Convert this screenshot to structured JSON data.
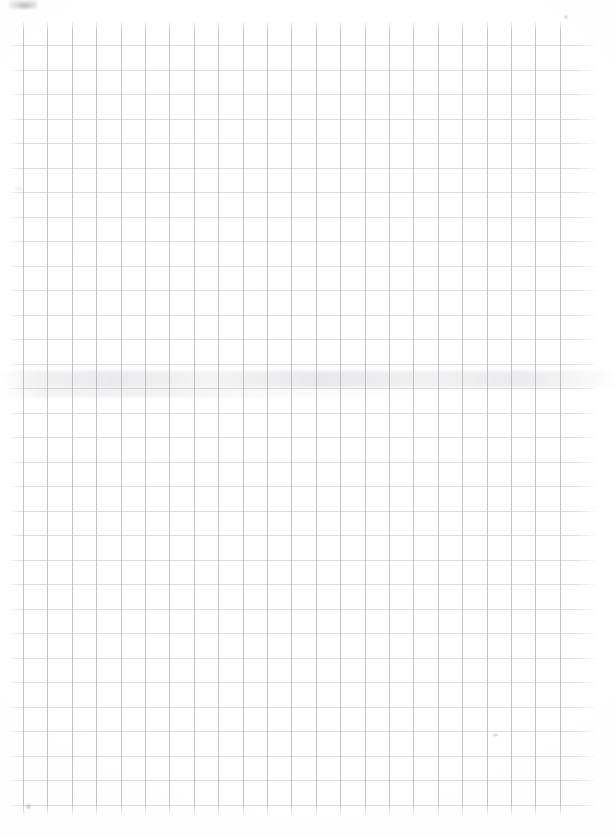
{
  "document": {
    "type": "scanned-grid-paper",
    "title": "",
    "visible_text": "",
    "background_color": "#ffffff"
  },
  "grid": {
    "name": "graph-paper-grid",
    "line_color_horizontal": "#c9cacd",
    "line_color_vertical": "#bdbec2",
    "cell_width_px": 24.4,
    "cell_height_px": 24.5,
    "vertical_line_count": 23,
    "horizontal_line_count": 32,
    "first_vertical_x": 23,
    "first_horizontal_y": 45,
    "vertical_extent_top": 22,
    "vertical_extent_bottom": 815,
    "horizontal_extent_left": 10,
    "horizontal_extent_right": 595
  },
  "artifacts": [
    {
      "name": "smudge-band-center",
      "kind": "horizontal-stain",
      "y": 371,
      "description": "faint grey horizontal stain spanning full page width"
    },
    {
      "name": "smudge-band-secondary",
      "kind": "horizontal-stain",
      "y": 388,
      "description": "fainter secondary stain on left two-thirds"
    },
    {
      "name": "corner-smudge-top-left",
      "kind": "smudge",
      "x": 9,
      "y": 0,
      "description": "dark grey smudge clipped at top-left edge"
    },
    {
      "name": "speck-top-right",
      "kind": "speck",
      "x": 563,
      "y": 14,
      "description": "tiny light speck near top-right"
    },
    {
      "name": "speck-right-lower",
      "kind": "speck",
      "x": 492,
      "y": 733,
      "description": "small dash-like mark in lower right area"
    },
    {
      "name": "speck-bottom-left",
      "kind": "speck",
      "x": 25,
      "y": 803,
      "description": "small dot near bottom-left corner"
    },
    {
      "name": "speck-upper-left",
      "kind": "speck",
      "x": 14,
      "y": 186,
      "description": "very faint mark at left margin"
    }
  ],
  "page": {
    "width": 616,
    "height": 838
  }
}
